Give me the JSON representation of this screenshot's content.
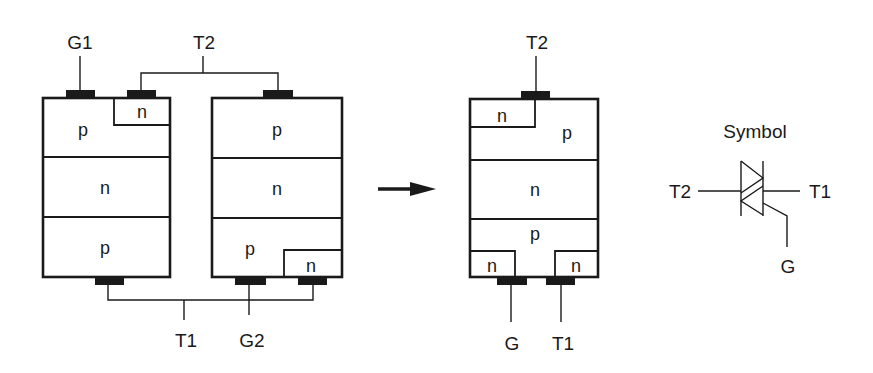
{
  "diagram": {
    "left_pair": {
      "scr1": {
        "terminal_top_left": "G1",
        "layers": [
          "p",
          "n",
          "p"
        ],
        "embedded_region_top": "n"
      },
      "scr2": {
        "layers": [
          "p",
          "n",
          "p"
        ],
        "embedded_region_bottom": "n"
      },
      "top_terminal": "T2",
      "bottom_terminal": "T1",
      "gate2": "G2"
    },
    "arrow": "right-arrow",
    "equivalent": {
      "top_terminal": "T2",
      "regions": {
        "top_n": "n",
        "top_p": "p",
        "middle_n": "n",
        "bottom_p": "p",
        "bottom_left_n": "n",
        "bottom_right_n": "n"
      },
      "gate": "G",
      "bottom_terminal": "T1"
    },
    "symbol": {
      "title": "Symbol",
      "left_terminal": "T2",
      "right_terminal": "T1",
      "gate": "G"
    }
  },
  "colors": {
    "ink": "#1a1a1a",
    "background": "#ffffff"
  }
}
